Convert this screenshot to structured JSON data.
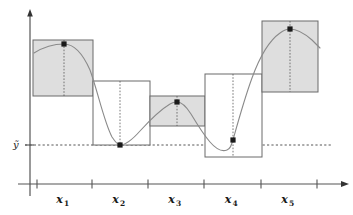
{
  "figure": {
    "type": "schematic-plot",
    "background": "#ffffff",
    "width": 353,
    "height": 215
  },
  "axes": {
    "x_axis": {
      "name": "x-axis",
      "y_pixel": 184,
      "x_start": 18,
      "x_end": 348,
      "arrow": true,
      "color": "#555555"
    },
    "y_axis": {
      "name": "y-axis",
      "x_pixel": 30,
      "y_start": 196,
      "y_end": 11,
      "arrow": true,
      "color": "#555555"
    },
    "tick_positions": [
      37,
      92,
      148,
      204,
      261,
      317
    ],
    "tick_labels": [
      "x1",
      "x2",
      "x3",
      "x4",
      "x5"
    ],
    "tick_label_display": [
      {
        "base": "x",
        "sub": "1"
      },
      {
        "base": "x",
        "sub": "2"
      },
      {
        "base": "x",
        "sub": "3"
      },
      {
        "base": "x",
        "sub": "4"
      },
      {
        "base": "x",
        "sub": "5"
      }
    ]
  },
  "reference_line": {
    "name": "y-tilde-reference",
    "label": "ỹ",
    "label_x": 13,
    "label_y": 148,
    "y_pixel": 145,
    "x_start": 25,
    "x_end": 332,
    "style": "dashed",
    "color": "#2b2b2b"
  },
  "boxes": [
    {
      "name": "box-1",
      "x": 33,
      "y": 40,
      "w": 60,
      "h": 56,
      "filled": true,
      "fill": "#dedede",
      "stroke": "#6a6a6a"
    },
    {
      "name": "box-2",
      "x": 93,
      "y": 81,
      "w": 57,
      "h": 64,
      "filled": false,
      "fill": "#ffffff",
      "stroke": "#6a6a6a"
    },
    {
      "name": "box-3",
      "x": 150,
      "y": 96,
      "w": 55,
      "h": 30,
      "filled": true,
      "fill": "#dedede",
      "stroke": "#6a6a6a"
    },
    {
      "name": "box-4",
      "x": 205,
      "y": 74,
      "w": 57,
      "h": 83,
      "filled": false,
      "fill": "#ffffff",
      "stroke": "#6a6a6a"
    },
    {
      "name": "box-5",
      "x": 262,
      "y": 21,
      "w": 56,
      "h": 71,
      "filled": true,
      "fill": "#dedede",
      "stroke": "#6a6a6a"
    }
  ],
  "data_points": [
    {
      "name": "point-1",
      "cx": 64,
      "cy": 44
    },
    {
      "name": "point-2",
      "cx": 120,
      "cy": 145
    },
    {
      "name": "point-3",
      "cx": 177,
      "cy": 102
    },
    {
      "name": "point-4",
      "cx": 233,
      "cy": 140
    },
    {
      "name": "point-5",
      "cx": 290,
      "cy": 29
    }
  ],
  "drop_lines": [
    {
      "name": "drop-line-1",
      "x": 64,
      "y1": 40,
      "y2": 96
    },
    {
      "name": "drop-line-2",
      "x": 120,
      "y1": 81,
      "y2": 145
    },
    {
      "name": "drop-line-3",
      "x": 177,
      "y1": 96,
      "y2": 126
    },
    {
      "name": "drop-line-4",
      "x": 233,
      "y1": 74,
      "y2": 157
    },
    {
      "name": "drop-line-5",
      "x": 290,
      "y1": 21,
      "y2": 92
    }
  ],
  "curve": {
    "name": "smooth-response-curve",
    "color": "#8a8a8a",
    "stroke_width": 1.1,
    "points": "M 34,53 C 42,48 52,44 64,44 C 74,44 82,52 90,70 C 98,92 104,122 112,137 C 116,143 118,145 120,145 C 126,145 132,140 140,131 C 150,120 160,110 170,104 C 173,102 175,102 177,102 C 182,102 186,106 191,114 C 197,124 203,134 210,142 C 216,149 222,152 227,150 C 230,149 231,146 233,140 C 238,122 244,100 252,78 C 260,56 270,40 280,33 C 284,30 287,29 290,29 C 296,29 304,33 312,40 C 316,44 318,46 320,48"
  }
}
